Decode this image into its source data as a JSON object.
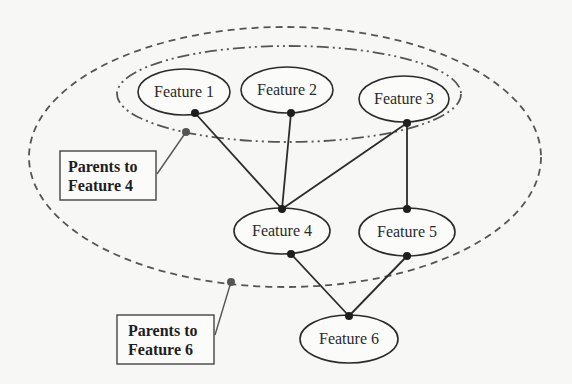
{
  "diagram": {
    "nodes": [
      {
        "id": "f1",
        "label": "Feature 1",
        "cx": 184,
        "cy": 92,
        "rx": 46,
        "ry": 23
      },
      {
        "id": "f2",
        "label": "Feature 2",
        "cx": 287,
        "cy": 90,
        "rx": 46,
        "ry": 23
      },
      {
        "id": "f3",
        "label": "Feature 3",
        "cx": 404,
        "cy": 99,
        "rx": 45,
        "ry": 23
      },
      {
        "id": "f4",
        "label": "Feature 4",
        "cx": 282,
        "cy": 231,
        "rx": 48,
        "ry": 23
      },
      {
        "id": "f5",
        "label": "Feature 5",
        "cx": 407,
        "cy": 232,
        "rx": 48,
        "ry": 24
      },
      {
        "id": "f6",
        "label": "Feature 6",
        "cx": 349,
        "cy": 339,
        "rx": 49,
        "ry": 24
      }
    ],
    "edges": [
      {
        "from": "f1",
        "to": "f4"
      },
      {
        "from": "f2",
        "to": "f4"
      },
      {
        "from": "f3",
        "to": "f4"
      },
      {
        "from": "f3",
        "to": "f5"
      },
      {
        "from": "f4",
        "to": "f6"
      },
      {
        "from": "f5",
        "to": "f6"
      }
    ],
    "groups": [
      {
        "id": "parents-f4",
        "style": "dash-dot",
        "members": [
          "f1",
          "f2",
          "f3"
        ]
      },
      {
        "id": "parents-f6",
        "style": "dashed",
        "members": [
          "f1",
          "f2",
          "f3",
          "f4",
          "f5"
        ]
      }
    ],
    "callouts": [
      {
        "id": "callout-f4",
        "line1": "Parents to",
        "line2": "Feature 4"
      },
      {
        "id": "callout-f6",
        "line1": "Parents to",
        "line2": "Feature 6"
      }
    ],
    "colors": {
      "stroke": "#2b2b2b",
      "group_stroke": "#555555",
      "background": "#f7f7f6"
    }
  }
}
